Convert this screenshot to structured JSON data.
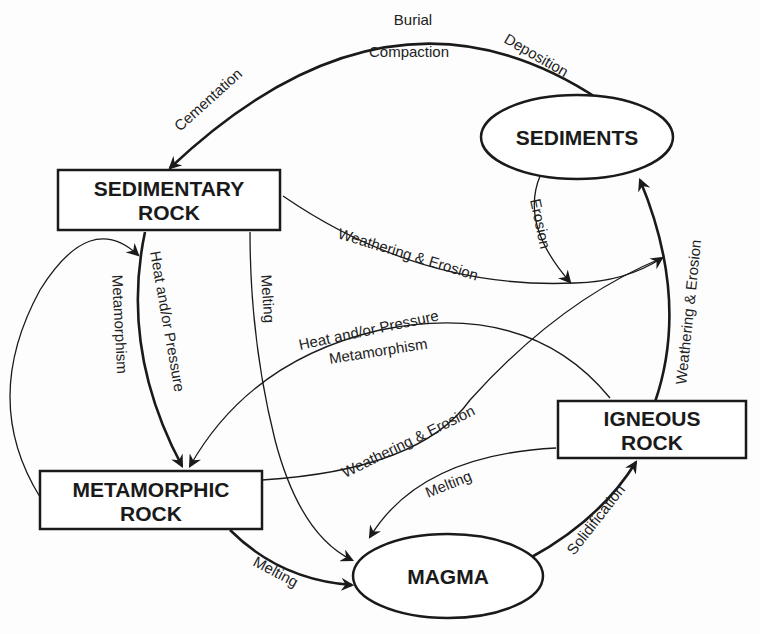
{
  "diagram": {
    "nodes": {
      "sediments": {
        "label": "SEDIMENTS",
        "shape": "ellipse"
      },
      "sedimentary_rock": {
        "line1": "SEDIMENTARY",
        "line2": "ROCK",
        "shape": "rectangle"
      },
      "metamorphic_rock": {
        "line1": "METAMORPHIC",
        "line2": "ROCK",
        "shape": "rectangle"
      },
      "igneous_rock": {
        "line1": "IGNEOUS",
        "line2": "ROCK",
        "shape": "rectangle"
      },
      "magma": {
        "label": "MAGMA",
        "shape": "ellipse"
      }
    },
    "edge_labels": {
      "burial": "Burial",
      "compaction": "Compaction",
      "deposition": "Deposition",
      "cementation": "Cementation",
      "erosion": "Erosion",
      "sed_weathering": "Weathering & Erosion",
      "ign_weathering": "Weathering & Erosion",
      "met_weathering": "Weathering & Erosion",
      "sed_heat": "Heat and/or Pressure",
      "sed_meta": "Metamorphism",
      "ign_heat": "Heat and/or Pressure",
      "ign_meta": "Metamorphism",
      "sed_melting": "Melting",
      "met_melting": "Melting",
      "ign_melting": "Melting",
      "solidification": "Solidification"
    },
    "edges": [
      {
        "from": "Sediments",
        "to": "Sedimentary Rock",
        "label": "Deposition / Burial / Compaction / Cementation"
      },
      {
        "from": "Sediments",
        "to": "Sediments junction",
        "label": "Erosion"
      },
      {
        "from": "Sedimentary Rock",
        "to": "Sediments",
        "label": "Weathering & Erosion"
      },
      {
        "from": "Sedimentary Rock",
        "to": "Metamorphic Rock",
        "label": "Heat and/or Pressure, Metamorphism"
      },
      {
        "from": "Metamorphic Rock",
        "to": "Metamorphic Rock",
        "label": "Metamorphism"
      },
      {
        "from": "Sedimentary Rock",
        "to": "Magma",
        "label": "Melting"
      },
      {
        "from": "Igneous Rock",
        "to": "Metamorphic Rock",
        "label": "Heat and/or Pressure, Metamorphism"
      },
      {
        "from": "Metamorphic Rock",
        "to": "Sediments",
        "label": "Weathering & Erosion"
      },
      {
        "from": "Igneous Rock",
        "to": "Sediments",
        "label": "Weathering & Erosion"
      },
      {
        "from": "Metamorphic Rock",
        "to": "Magma",
        "label": "Melting"
      },
      {
        "from": "Igneous Rock",
        "to": "Magma",
        "label": "Melting"
      },
      {
        "from": "Magma",
        "to": "Igneous Rock",
        "label": "Solidification"
      }
    ]
  }
}
